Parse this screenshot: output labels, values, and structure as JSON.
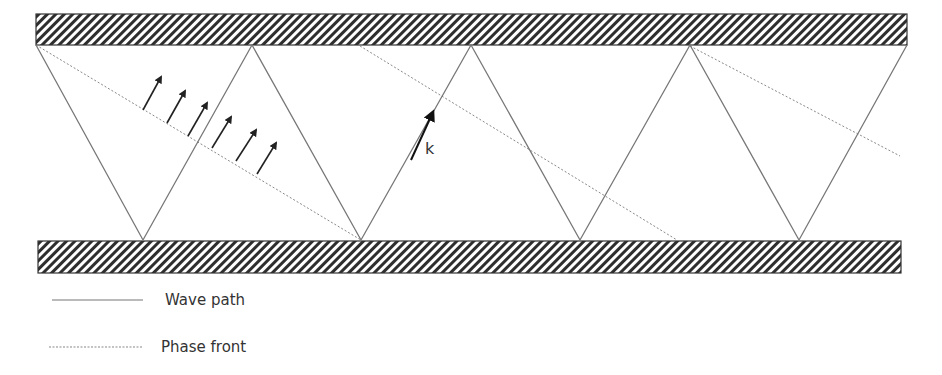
{
  "diagram": {
    "title": "",
    "colors": {
      "wall_stroke": "#333333",
      "wave_path": "#777777",
      "phase_front": "#888888",
      "arrow": "#222222",
      "text": "#333333"
    },
    "walls": [
      {
        "name": "top-wall",
        "x": 36,
        "y": 14,
        "width": 871,
        "height": 31
      },
      {
        "name": "bottom-wall",
        "x": 38,
        "y": 241,
        "width": 863,
        "height": 32
      }
    ],
    "wave_path_points": [
      [
        36,
        45
      ],
      [
        143,
        240
      ],
      [
        252,
        45
      ],
      [
        361,
        240
      ],
      [
        471,
        45
      ],
      [
        580,
        240
      ],
      [
        690,
        45
      ],
      [
        799,
        240
      ],
      [
        907,
        45
      ]
    ],
    "phase_fronts": [
      {
        "x1": 36,
        "y1": 45,
        "x2": 361,
        "y2": 240
      },
      {
        "x1": 360,
        "y1": 46,
        "x2": 677,
        "y2": 240
      },
      {
        "x1": 690,
        "y1": 46,
        "x2": 900,
        "y2": 156
      }
    ],
    "phase_arrows": [
      {
        "x1": 143,
        "y1": 110,
        "x2": 161,
        "y2": 77
      },
      {
        "x1": 167,
        "y1": 123,
        "x2": 185,
        "y2": 91
      },
      {
        "x1": 188,
        "y1": 136,
        "x2": 207,
        "y2": 103
      },
      {
        "x1": 212,
        "y1": 148,
        "x2": 231,
        "y2": 117
      },
      {
        "x1": 236,
        "y1": 161,
        "x2": 256,
        "y2": 130
      },
      {
        "x1": 257,
        "y1": 174,
        "x2": 276,
        "y2": 143
      }
    ],
    "k_vector": {
      "x1": 411,
      "y1": 160,
      "x2": 433,
      "y2": 112,
      "label": "k",
      "label_x": 425,
      "label_y": 154
    }
  },
  "legend": {
    "items": [
      {
        "label": "Wave path",
        "style": "solid",
        "line_x1": 52,
        "line_x2": 143,
        "y": 300
      },
      {
        "label": "Phase front",
        "style": "dotted",
        "line_x1": 49,
        "line_x2": 143,
        "y": 347
      }
    ]
  }
}
